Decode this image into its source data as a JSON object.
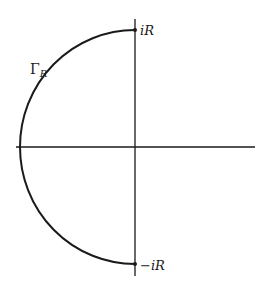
{
  "diagram": {
    "type": "contour-in-complex-plane",
    "curve_label": "Γ",
    "curve_label_subscript": "R",
    "top_point_label": "iR",
    "bottom_point_label": "−iR",
    "stroke_color": "#1a1a1a",
    "background": "#ffffff"
  }
}
